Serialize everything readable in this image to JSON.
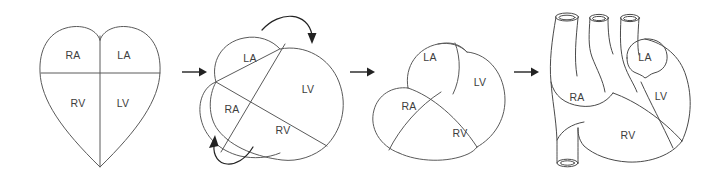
{
  "figure": {
    "background_color": "#ffffff",
    "line_color": "#5a5a5a",
    "label_color": "#3d3d3d",
    "arrow_color": "#222222"
  },
  "panels": [
    {
      "id": "panel-1",
      "name": "schematic-heart",
      "caption": "",
      "labels": [
        {
          "text": "RA",
          "x": 73,
          "y": 56
        },
        {
          "text": "LA",
          "x": 124,
          "y": 56
        },
        {
          "text": "RV",
          "x": 78,
          "y": 104
        },
        {
          "text": "LV",
          "x": 123,
          "y": 104
        }
      ]
    },
    {
      "id": "panel-2",
      "name": "rotating-heart",
      "caption": "",
      "labels": [
        {
          "text": "LA",
          "x": 250,
          "y": 59
        },
        {
          "text": "LV",
          "x": 308,
          "y": 90
        },
        {
          "text": "RA",
          "x": 232,
          "y": 110
        },
        {
          "text": "RV",
          "x": 283,
          "y": 131
        }
      ]
    },
    {
      "id": "panel-3",
      "name": "rotated-heart",
      "caption": "",
      "labels": [
        {
          "text": "LA",
          "x": 430,
          "y": 58
        },
        {
          "text": "LV",
          "x": 480,
          "y": 83
        },
        {
          "text": "RA",
          "x": 409,
          "y": 107
        },
        {
          "text": "RV",
          "x": 460,
          "y": 134
        }
      ]
    },
    {
      "id": "panel-4",
      "name": "anatomical-heart",
      "caption": "",
      "labels": [
        {
          "text": "LA",
          "x": 641,
          "y": 60
        },
        {
          "text": "RA",
          "x": 575,
          "y": 98
        },
        {
          "text": "LV",
          "x": 660,
          "y": 97
        },
        {
          "text": "RV",
          "x": 628,
          "y": 136
        }
      ]
    }
  ],
  "arrows": {
    "transition": [
      {
        "name": "arrow-panel1-to-panel2",
        "x1": 182,
        "y1": 72,
        "x2": 204,
        "y2": 72
      },
      {
        "name": "arrow-panel2-to-panel3",
        "x1": 348,
        "y1": 72,
        "x2": 370,
        "y2": 72
      },
      {
        "name": "arrow-panel3-to-panel4",
        "x1": 512,
        "y1": 72,
        "x2": 534,
        "y2": 72
      }
    ],
    "rotation": [
      {
        "name": "rotation-arrow-top",
        "direction": "clockwise-down"
      },
      {
        "name": "rotation-arrow-bottom",
        "direction": "counterclockwise-up"
      }
    ]
  },
  "legend": {
    "abbreviations": [
      {
        "code": "RA",
        "meaning": "right atrium"
      },
      {
        "code": "LA",
        "meaning": "left atrium"
      },
      {
        "code": "RV",
        "meaning": "right ventricle"
      },
      {
        "code": "LV",
        "meaning": "left ventricle"
      }
    ]
  }
}
